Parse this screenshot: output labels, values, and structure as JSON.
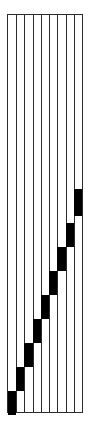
{
  "figure": {
    "width": 91,
    "height": 424,
    "background_color": "#ffffff"
  },
  "frame": {
    "x": 7,
    "y": 14,
    "width": 76,
    "height": 399,
    "border_color": "#2b2b2b",
    "border_width": 1,
    "fill_color": "#ffffff"
  },
  "grid": {
    "column_count": 9,
    "divider_count": 8,
    "divider_color": "#2b2b2b",
    "divider_width": 1,
    "column_width": 8.44
  },
  "chart_data": {
    "type": "bar",
    "subtitle": "",
    "xlabel": "",
    "ylabel": "",
    "orientation": "vertical",
    "grid": true,
    "legend": false,
    "bar_color": "#000000",
    "background_color": "#ffffff",
    "frame_color": "#2b2b2b",
    "categories": [
      "1",
      "2",
      "3",
      "4",
      "5",
      "6",
      "7",
      "8",
      "9"
    ],
    "ylim": [
      0,
      399
    ],
    "block_height": 24,
    "step": 24,
    "series": [
      {
        "name": "block top offset from frame top (px)",
        "values": [
          376,
          352,
          328,
          304,
          280,
          256,
          232,
          208,
          174
        ]
      },
      {
        "name": "block height (px)",
        "values": [
          24,
          24,
          24,
          24,
          24,
          24,
          24,
          24,
          27
        ]
      }
    ],
    "blocks": [
      {
        "column": 1,
        "top": 376,
        "height": 24
      },
      {
        "column": 2,
        "top": 352,
        "height": 24
      },
      {
        "column": 3,
        "top": 328,
        "height": 24
      },
      {
        "column": 4,
        "top": 304,
        "height": 24
      },
      {
        "column": 5,
        "top": 280,
        "height": 24
      },
      {
        "column": 6,
        "top": 256,
        "height": 24
      },
      {
        "column": 7,
        "top": 232,
        "height": 24
      },
      {
        "column": 8,
        "top": 208,
        "height": 24
      },
      {
        "column": 9,
        "top": 174,
        "height": 27
      }
    ]
  }
}
